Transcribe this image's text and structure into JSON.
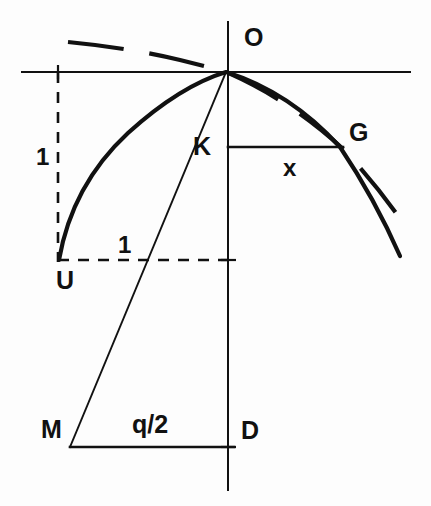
{
  "figure": {
    "kind": "geometric-construction-diagram",
    "background_color": "#fdfdfd",
    "ink_color": "#111111",
    "width": 431,
    "height": 506
  },
  "labels": {
    "origin": "O",
    "point_k": "K",
    "point_g": "G",
    "point_u": "U",
    "point_m": "M",
    "point_d": "D",
    "segment_x": "x",
    "segment_q_half": "q/2",
    "unit_vertical": "1",
    "unit_horizontal": "1"
  },
  "label_positions": {
    "origin": {
      "x": 244,
      "y": 46
    },
    "point_k": {
      "x": 211,
      "y": 155
    },
    "point_g": {
      "x": 349,
      "y": 141
    },
    "point_u": {
      "x": 56,
      "y": 289
    },
    "point_m": {
      "x": 41,
      "y": 438
    },
    "point_d": {
      "x": 241,
      "y": 439
    },
    "segment_x": {
      "x": 283,
      "y": 176
    },
    "segment_q_half": {
      "x": 132,
      "y": 433
    },
    "unit_vertical": {
      "x": 36,
      "y": 165
    },
    "unit_horizontal": {
      "x": 118,
      "y": 253
    }
  },
  "geometry": {
    "origin_point": {
      "x": 226,
      "y": 72
    },
    "vertical_axis": {
      "x": 228,
      "y_top": 22,
      "y_bottom": 490
    },
    "horizontal_axis": {
      "y": 72,
      "x_left": 22,
      "x_right": 410
    },
    "point_u": {
      "x": 59,
      "y": 260
    },
    "point_k": {
      "x": 228,
      "y": 147
    },
    "point_g": {
      "x": 342,
      "y": 148
    },
    "point_m": {
      "x": 70,
      "y": 447
    },
    "point_d": {
      "x": 228,
      "y": 447
    },
    "dashed_vertical_guide": {
      "x": 58,
      "y_top": 72,
      "y_bottom": 262
    },
    "dashed_horizontal_guide": {
      "y": 260,
      "x_left": 58,
      "x_right": 232
    },
    "chord_kg": {
      "y": 147,
      "x_left": 228,
      "x_right": 342
    },
    "base_md": {
      "y": 447,
      "x_left": 70,
      "x_right": 232
    },
    "ray_m_to_o": {
      "x1": 70,
      "y1": 447,
      "x2": 226,
      "y2": 72
    },
    "solid_parabola": "M 59 260 Q 72 185 128 133 Q 180 86 226 72 Q 290 92 340 147 Q 375 199 400 256",
    "dashed_parabola": "M 68 42 Q 130 48 180 60 Q 212 68 226 72 Q 290 100 342 148 Q 378 186 408 230",
    "dash_pattern_curve": "56 26",
    "dash_pattern_guide": "11 9"
  },
  "stroke_widths": {
    "axis": 2.0,
    "solid_curve": 4.2,
    "dashed_curve": 4.2,
    "guide_dashed": 2.6,
    "connector": 2.6,
    "ray": 1.9,
    "tick": 2.2
  },
  "font_sizes": {
    "letter_label": 25,
    "numeric_label": 24,
    "fraction_label": 25
  }
}
